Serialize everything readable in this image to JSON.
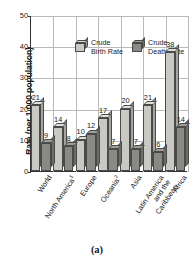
{
  "chart_data": {
    "type": "bar",
    "title": "",
    "xlabel": "",
    "ylabel": "Rate (per 1,000 population)",
    "ylim": [
      0,
      50
    ],
    "yticks": [
      0,
      10,
      20,
      30,
      40,
      50
    ],
    "grid": true,
    "legend_position": "top-inside",
    "categories": [
      "World",
      "North America",
      "Europe",
      "Oceania",
      "Asia",
      "Latin America\nand the\nCaribbean",
      "Africa"
    ],
    "category_footnotes": [
      "",
      "1",
      "",
      "2",
      "",
      "",
      ""
    ],
    "series": [
      {
        "name": "Crude\nBirth Rate",
        "values": [
          21,
          14,
          10,
          17,
          20,
          21,
          38
        ]
      },
      {
        "name": "Crude\nDeath Rate",
        "values": [
          9,
          8,
          12,
          7,
          7,
          6,
          14
        ]
      }
    ]
  },
  "caption": "(a)"
}
